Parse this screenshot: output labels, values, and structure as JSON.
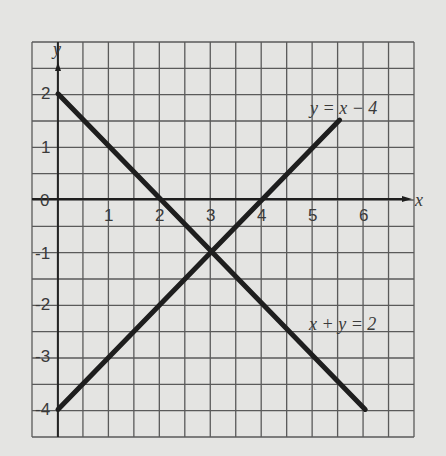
{
  "chart_data": {
    "type": "line",
    "title": "",
    "xlabel": "x",
    "ylabel": "y",
    "xlim": [
      -0.5,
      7.0
    ],
    "ylim": [
      -4.5,
      3.0
    ],
    "grid": true,
    "grid_step": 0.5,
    "x_ticks": [
      "1",
      "2",
      "3",
      "4",
      "5",
      "6"
    ],
    "y_ticks": [
      "2",
      "1",
      "0",
      "-1",
      "-2",
      "-3",
      "-4"
    ],
    "series": [
      {
        "name": "x + y = 2",
        "x": [
          0,
          6
        ],
        "y": [
          2,
          -4
        ]
      },
      {
        "name": "y = x - 4",
        "x": [
          0,
          5.5
        ],
        "y": [
          -4,
          1.5
        ]
      }
    ],
    "annotations": [
      {
        "text": "y = x - 4",
        "x": 5.2,
        "y": 1.8
      },
      {
        "text": "x + y = 2",
        "x": 5.2,
        "y": -2.3
      },
      {
        "text": "intersection",
        "x": 3,
        "y": -1
      }
    ],
    "colors": {
      "background": "#e4e4e2",
      "grid": "#5a5a5a",
      "line": "#1e1e1e"
    }
  },
  "labels": {
    "x_axis": "x",
    "y_axis": "y",
    "line1": "y = x − 4",
    "line2": "x + y = 2",
    "origin": "0",
    "xt": [
      "1",
      "2",
      "3",
      "4",
      "5",
      "6"
    ],
    "yt": [
      "2",
      "1",
      "-1",
      "-2",
      "-3",
      "-4"
    ]
  }
}
